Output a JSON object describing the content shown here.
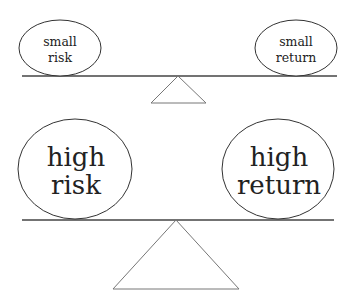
{
  "diagram": {
    "colors": {
      "background": "#ffffff",
      "stroke": "#333333",
      "text": "#222222",
      "fulcrum": "#777777"
    },
    "top_scale": {
      "left": {
        "line1": "small",
        "line2": "risk"
      },
      "right": {
        "line1": "small",
        "line2": "return"
      }
    },
    "bottom_scale": {
      "left": {
        "line1": "high",
        "line2": "risk"
      },
      "right": {
        "line1": "high",
        "line2": "return"
      }
    }
  }
}
